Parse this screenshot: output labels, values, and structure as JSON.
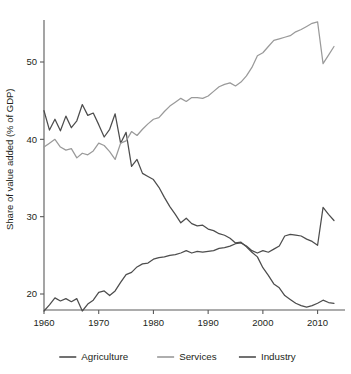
{
  "chart_data": {
    "type": "line",
    "title": "",
    "subtitle": "",
    "xlabel": "",
    "ylabel": "Share of value added (% of GDP)",
    "xlim": [
      1960,
      2013
    ],
    "ylim": [
      17,
      56
    ],
    "xticks": [
      1960,
      1970,
      1980,
      1990,
      2000,
      2010
    ],
    "yticks": [
      20,
      30,
      40,
      50
    ],
    "xtick_labels": [
      "1960",
      "1970",
      "1980",
      "1990",
      "2000",
      "2010"
    ],
    "ytick_labels": [
      "20",
      "30",
      "40",
      "50"
    ],
    "grid": false,
    "legend_position": "bottom",
    "x": [
      1960,
      1961,
      1962,
      1963,
      1964,
      1965,
      1966,
      1967,
      1968,
      1969,
      1970,
      1971,
      1972,
      1973,
      1974,
      1975,
      1976,
      1977,
      1978,
      1979,
      1980,
      1981,
      1982,
      1983,
      1984,
      1985,
      1986,
      1987,
      1988,
      1989,
      1990,
      1991,
      1992,
      1993,
      1994,
      1995,
      1996,
      1997,
      1998,
      1999,
      2000,
      2001,
      2002,
      2003,
      2004,
      2005,
      2006,
      2007,
      2008,
      2009,
      2010,
      2011,
      2012,
      2013
    ],
    "series": [
      {
        "name": "Agriculture",
        "color": "#4d4d4d",
        "values": [
          43.7,
          41.2,
          42.6,
          41.1,
          43.0,
          41.5,
          42.4,
          44.5,
          43.1,
          43.4,
          41.9,
          40.3,
          41.3,
          43.3,
          39.5,
          40.9,
          36.5,
          37.4,
          35.6,
          35.2,
          34.8,
          33.8,
          32.5,
          31.3,
          30.3,
          29.2,
          29.8,
          29.1,
          28.8,
          28.9,
          28.4,
          28.2,
          27.8,
          27.6,
          27.2,
          26.6,
          26.7,
          26.1,
          25.4,
          24.8,
          23.4,
          22.4,
          21.3,
          20.8,
          19.8,
          19.3,
          18.8,
          18.5,
          18.3,
          18.5,
          18.8,
          19.2,
          18.9,
          18.8
        ]
      },
      {
        "name": "Services",
        "color": "#9a9a9a",
        "values": [
          39.0,
          39.5,
          40.0,
          39.0,
          38.6,
          38.8,
          37.6,
          38.2,
          38.0,
          38.5,
          39.5,
          39.2,
          38.4,
          37.4,
          39.5,
          39.8,
          41.0,
          40.5,
          41.3,
          42.0,
          42.6,
          42.8,
          43.6,
          44.3,
          44.8,
          45.3,
          44.9,
          45.4,
          45.4,
          45.3,
          45.6,
          46.2,
          46.8,
          47.1,
          47.3,
          46.9,
          47.4,
          48.2,
          49.3,
          50.8,
          51.2,
          52.0,
          52.8,
          53.0,
          53.2,
          53.4,
          53.9,
          54.2,
          54.6,
          55.0,
          55.2,
          49.8,
          50.9,
          52.0
        ]
      },
      {
        "name": "Industry",
        "color": "#4d4d4d",
        "values": [
          17.8,
          18.6,
          19.5,
          19.1,
          19.4,
          19.0,
          19.4,
          17.8,
          18.7,
          19.2,
          20.2,
          20.4,
          19.8,
          20.4,
          21.5,
          22.5,
          22.8,
          23.5,
          23.9,
          24.0,
          24.5,
          24.7,
          24.8,
          25.0,
          25.1,
          25.3,
          25.6,
          25.3,
          25.5,
          25.4,
          25.5,
          25.6,
          25.9,
          26.0,
          26.2,
          26.5,
          26.6,
          26.2,
          25.6,
          25.3,
          25.6,
          25.4,
          25.8,
          26.2,
          27.5,
          27.7,
          27.6,
          27.5,
          27.1,
          26.8,
          26.3,
          31.2,
          30.3,
          29.5
        ]
      }
    ]
  },
  "legend": {
    "items": [
      {
        "label": "Agriculture"
      },
      {
        "label": "Services"
      },
      {
        "label": "Industry"
      }
    ]
  }
}
